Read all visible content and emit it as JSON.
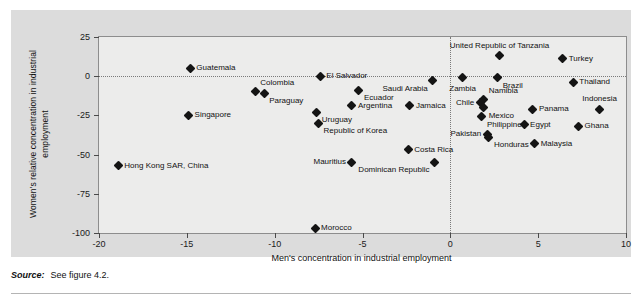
{
  "chart_data": {
    "type": "scatter",
    "title": "",
    "xlabel": "Men's concentration in industrial employment",
    "ylabel": "Women's relative concentration in industrial employment",
    "xlim": [
      -20,
      10
    ],
    "ylim": [
      -100,
      25
    ],
    "xticks": [
      "-20",
      "-15",
      "-10",
      "-5",
      "0",
      "5",
      "10"
    ],
    "xtick_values": [
      -20,
      -15,
      -10,
      -5,
      0,
      5,
      10
    ],
    "yticks": [
      "25",
      "0",
      "-25",
      "-50",
      "-75",
      "-100"
    ],
    "ytick_values": [
      25,
      0,
      -25,
      -50,
      -75,
      -100
    ],
    "grid": false,
    "reference_lines": [
      {
        "axis": "y",
        "value": 0,
        "style": "dotted"
      },
      {
        "axis": "x",
        "value": 0,
        "style": "dotted"
      }
    ],
    "legend": "none",
    "points": [
      {
        "label": "Guatemala",
        "x": -14.8,
        "y": 5,
        "pos": "right"
      },
      {
        "label": "Colombia",
        "x": -11.1,
        "y": -10,
        "pos": "ar"
      },
      {
        "label": "Paraguay",
        "x": -10.6,
        "y": -11,
        "pos": "br"
      },
      {
        "label": "Singapore",
        "x": -14.9,
        "y": -25,
        "pos": "right"
      },
      {
        "label": "Hong Kong SAR, China",
        "x": -18.9,
        "y": -57,
        "pos": "right"
      },
      {
        "label": "El Salvador",
        "x": -7.4,
        "y": 0,
        "pos": "right"
      },
      {
        "label": "Ecuador",
        "x": -5.2,
        "y": -9,
        "pos": "br"
      },
      {
        "label": "Saudi Arabia",
        "x": -1.0,
        "y": -3,
        "pos": "bl"
      },
      {
        "label": "Argentina",
        "x": -5.6,
        "y": -19,
        "pos": "right"
      },
      {
        "label": "Jamaica",
        "x": -2.3,
        "y": -19,
        "pos": "right"
      },
      {
        "label": "Uruguay",
        "x": -7.6,
        "y": -23,
        "pos": "br"
      },
      {
        "label": "Republic of Korea",
        "x": -7.5,
        "y": -30,
        "pos": "br"
      },
      {
        "label": "Costa Rica",
        "x": -2.4,
        "y": -47,
        "pos": "right"
      },
      {
        "label": "Mauritius",
        "x": -5.6,
        "y": -55,
        "pos": "left"
      },
      {
        "label": "Dominican Republic",
        "x": -0.9,
        "y": -55,
        "pos": "bl"
      },
      {
        "label": "Morocco",
        "x": -7.7,
        "y": -97,
        "pos": "right"
      },
      {
        "label": "United Republic of Tanzania",
        "x": 2.8,
        "y": 13,
        "pos": "above"
      },
      {
        "label": "Turkey",
        "x": 6.4,
        "y": 11,
        "pos": "right"
      },
      {
        "label": "Zambia",
        "x": 0.7,
        "y": -1,
        "pos": "below"
      },
      {
        "label": "Brazil",
        "x": 2.7,
        "y": -1,
        "pos": "br"
      },
      {
        "label": "Thailand",
        "x": 7.0,
        "y": -4,
        "pos": "right"
      },
      {
        "label": "Namibia",
        "x": 1.9,
        "y": -15,
        "pos": "ar"
      },
      {
        "label": "Chile",
        "x": 1.7,
        "y": -17,
        "pos": "left"
      },
      {
        "label": "Mexico",
        "x": 1.9,
        "y": -20,
        "pos": "br"
      },
      {
        "label": "Panama",
        "x": 4.7,
        "y": -21,
        "pos": "right"
      },
      {
        "label": "Indonesia",
        "x": 8.5,
        "y": -21,
        "pos": "above"
      },
      {
        "label": "Philippines",
        "x": 1.8,
        "y": -26,
        "pos": "br"
      },
      {
        "label": "Egypt",
        "x": 4.2,
        "y": -31,
        "pos": "right"
      },
      {
        "label": "Ghana",
        "x": 7.3,
        "y": -32,
        "pos": "right"
      },
      {
        "label": "Pakistan",
        "x": 2.1,
        "y": -37,
        "pos": "left"
      },
      {
        "label": "Honduras",
        "x": 2.2,
        "y": -39,
        "pos": "br"
      },
      {
        "label": "Malaysia",
        "x": 4.8,
        "y": -43,
        "pos": "right"
      }
    ]
  },
  "footer": {
    "source_label": "Source:",
    "source_text": "See figure 4.2."
  }
}
